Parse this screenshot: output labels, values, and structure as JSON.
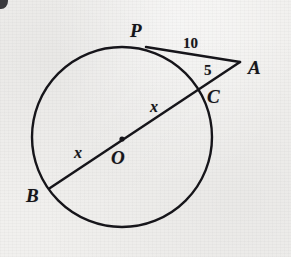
{
  "figure": {
    "type": "geometry-diagram",
    "background_color": "#f1f0ee",
    "ink_color": "#16151a",
    "circle": {
      "name": "main-circle",
      "center_x": 122,
      "center_y": 137,
      "radius": 90,
      "stroke_width": 2.4
    },
    "center_dot": {
      "name": "center-point-o",
      "x": 122,
      "y": 139,
      "radius": 2.6
    },
    "points": {
      "P": {
        "x": 146,
        "y": 47
      },
      "A": {
        "x": 240,
        "y": 62
      },
      "C": {
        "x": 206,
        "y": 89
      },
      "B": {
        "x": 50,
        "y": 188
      },
      "O": {
        "x": 122,
        "y": 139
      }
    },
    "segments": [
      {
        "name": "tangent-segment-pa",
        "x1": 146,
        "y1": 47,
        "x2": 240,
        "y2": 62
      },
      {
        "name": "secant-segment-ba",
        "x1": 50,
        "y1": 188,
        "x2": 240,
        "y2": 62
      }
    ],
    "labels": [
      {
        "id": "label-p",
        "name": "point-label-p",
        "text": "P",
        "x": 130,
        "y": 21,
        "kind": "point"
      },
      {
        "id": "label-a",
        "name": "point-label-a",
        "text": "A",
        "x": 248,
        "y": 58,
        "kind": "point"
      },
      {
        "id": "label-c",
        "name": "point-label-c",
        "text": "C",
        "x": 207,
        "y": 87,
        "kind": "point"
      },
      {
        "id": "label-b",
        "name": "point-label-b",
        "text": "B",
        "x": 26,
        "y": 186,
        "kind": "point"
      },
      {
        "id": "label-o",
        "name": "center-label-o",
        "text": "O",
        "x": 111,
        "y": 148,
        "kind": "point"
      },
      {
        "id": "label-ten",
        "name": "measure-label-10",
        "text": "10",
        "x": 183,
        "y": 36,
        "kind": "number"
      },
      {
        "id": "label-five",
        "name": "measure-label-5",
        "text": "5",
        "x": 204,
        "y": 63,
        "kind": "number"
      },
      {
        "id": "label-x-upper",
        "name": "measure-label-x-upper",
        "text": "x",
        "x": 150,
        "y": 99,
        "kind": "variable"
      },
      {
        "id": "label-x-lower",
        "name": "measure-label-x-lower",
        "text": "x",
        "x": 74,
        "y": 145,
        "kind": "variable"
      }
    ]
  },
  "chart_data": {
    "type": "diagram",
    "title": "",
    "annotations": [
      {
        "label": "10",
        "meaning": "length of tangent segment PA"
      },
      {
        "label": "5",
        "meaning": "length of external secant segment CA"
      },
      {
        "label": "x",
        "meaning": "length of segment OC (radius)"
      },
      {
        "label": "x",
        "meaning": "length of segment BO (radius)"
      }
    ],
    "vertices": [
      "P",
      "A",
      "C",
      "O",
      "B"
    ]
  }
}
